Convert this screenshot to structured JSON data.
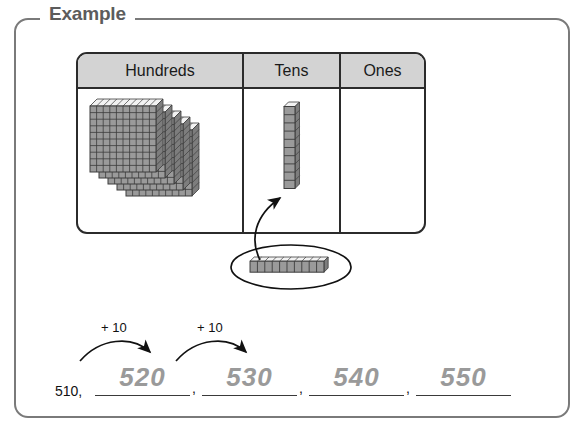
{
  "frame": {
    "legend": "Example"
  },
  "table": {
    "columns": [
      {
        "label": "Hundreds",
        "blocks": {
          "type": "hundreds-flat",
          "count": 5
        }
      },
      {
        "label": "Tens",
        "blocks": {
          "type": "tens-rod",
          "count": 1
        }
      },
      {
        "label": "Ones",
        "blocks": {
          "type": "ones-cube",
          "count": 0
        }
      }
    ]
  },
  "callout": {
    "shape": "ellipse",
    "contents": {
      "type": "tens-rod-horizontal",
      "units": 10
    },
    "pointer": "curved-arrow-to-tens-column"
  },
  "sequence": {
    "start": "510,",
    "operations": [
      {
        "label": "+ 10"
      },
      {
        "label": "+ 10"
      }
    ],
    "blanks": [
      {
        "value": "520",
        "separator": ","
      },
      {
        "value": "530",
        "separator": ","
      },
      {
        "value": "540",
        "separator": ","
      },
      {
        "value": "550",
        "separator": ""
      }
    ]
  },
  "colors": {
    "block_fill": "#9a9a9a",
    "block_line": "#3c3c3c",
    "block_top_face": "#f2f2f2",
    "header_bg": "#d3d3d3",
    "table_border": "#2b2b2b",
    "frame_border": "#7a7a7a",
    "legend_text": "#5c5c5c",
    "answer_text": "#9a9a9a",
    "given_text": "#111111"
  },
  "chart_data": {
    "type": "table",
    "categories": [
      "Hundreds",
      "Tens",
      "Ones"
    ],
    "values": [
      5,
      1,
      0
    ],
    "represented_number": 510,
    "skip_count_by": 10,
    "sequence_values": [
      510,
      520,
      530,
      540,
      550
    ]
  }
}
